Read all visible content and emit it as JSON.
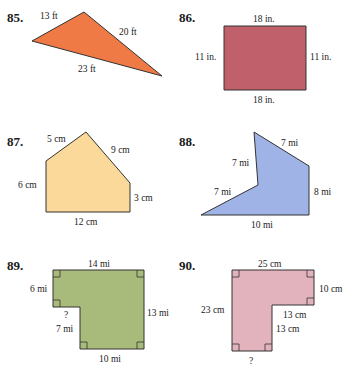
{
  "colors": {
    "p85": "#f07a45",
    "p86": "#c0606a",
    "p87": "#fbd99a",
    "p88": "#9fb3e6",
    "p89": "#a9bb7a",
    "p90": "#e3b3bd",
    "stroke": "#333333"
  },
  "problems": [
    {
      "number": "85.",
      "shape": "triangle",
      "points": "32,41 84,12 162,76",
      "labels": [
        "13 ft",
        "20 ft",
        "23 ft"
      ]
    },
    {
      "number": "86.",
      "shape": "rectangle",
      "points": "224,26 306,26 306,90 224,90",
      "labels": [
        "18 in.",
        "11 in.",
        "11 in.",
        "18 in."
      ]
    },
    {
      "number": "87.",
      "shape": "pentagon",
      "points": "46,161 86,132 130,183 130,212 46,212",
      "labels": [
        "5 cm",
        "9 cm",
        "6 cm",
        "3 cm",
        "12 cm"
      ]
    },
    {
      "number": "88.",
      "shape": "concave-pentagon",
      "points": "254,132 309,166 309,215 201,215 258,185",
      "labels": [
        "7 mi",
        "7 mi",
        "7 mi",
        "8 mi",
        "10 mi"
      ]
    },
    {
      "number": "89.",
      "shape": "L-shape",
      "points": "53,270 144,270 144,349 80,349 80,307 53,307",
      "labels": [
        "14 mi",
        "6 mi",
        "?",
        "7 mi",
        "13 mi",
        "10 mi"
      ]
    },
    {
      "number": "90.",
      "shape": "L-shape",
      "points": "232,270 314,270 314,305 272,305 272,351 232,351",
      "labels": [
        "25 cm",
        "10 cm",
        "23 cm",
        "13 cm",
        "13 cm",
        "?"
      ]
    }
  ]
}
